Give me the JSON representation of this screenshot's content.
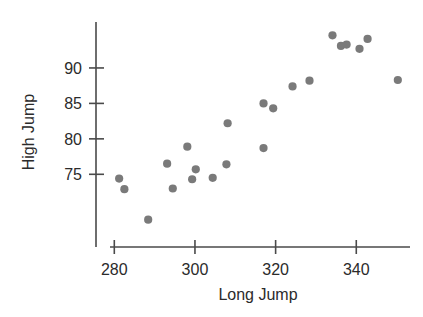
{
  "chart_data": {
    "type": "scatter",
    "title": "",
    "xlabel": "Long Jump",
    "ylabel": "High Jump",
    "xlim": [
      276,
      356
    ],
    "ylim": [
      67,
      96.5
    ],
    "xticks": [
      280,
      300,
      320,
      340
    ],
    "yticks": [
      75,
      80,
      85,
      90
    ],
    "xtick_labels": [
      "280",
      "300",
      "320",
      "340"
    ],
    "ytick_labels": [
      "75",
      "80",
      "85",
      "90"
    ],
    "grid": false,
    "legend": null,
    "marker_color": "#7a7a7a",
    "axis_color": "#4a4a4a",
    "points": [
      {
        "x": 281.2,
        "y": 74.4
      },
      {
        "x": 282.5,
        "y": 72.9
      },
      {
        "x": 288.4,
        "y": 68.6
      },
      {
        "x": 293.1,
        "y": 76.5
      },
      {
        "x": 294.5,
        "y": 73.0
      },
      {
        "x": 298.1,
        "y": 78.9
      },
      {
        "x": 299.3,
        "y": 74.3
      },
      {
        "x": 300.2,
        "y": 75.7
      },
      {
        "x": 304.4,
        "y": 74.5
      },
      {
        "x": 307.8,
        "y": 76.4
      },
      {
        "x": 308.1,
        "y": 82.2
      },
      {
        "x": 317.0,
        "y": 78.7
      },
      {
        "x": 317.0,
        "y": 85.0
      },
      {
        "x": 319.4,
        "y": 84.3
      },
      {
        "x": 324.2,
        "y": 87.4
      },
      {
        "x": 328.4,
        "y": 88.2
      },
      {
        "x": 334.1,
        "y": 94.6
      },
      {
        "x": 336.2,
        "y": 93.1
      },
      {
        "x": 337.6,
        "y": 93.3
      },
      {
        "x": 340.8,
        "y": 92.7
      },
      {
        "x": 342.8,
        "y": 94.1
      },
      {
        "x": 350.3,
        "y": 88.3
      }
    ]
  }
}
